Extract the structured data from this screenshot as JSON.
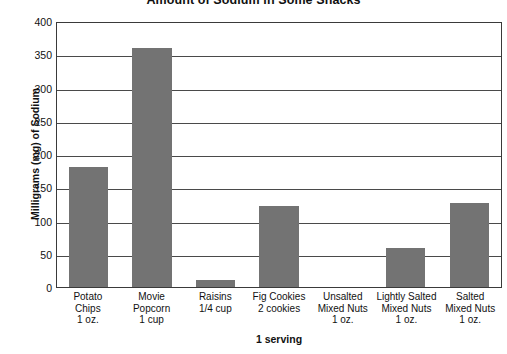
{
  "chart_data": {
    "type": "bar",
    "title": "Amount of Sodium in Some Snacks",
    "xlabel": "1 serving",
    "ylabel": "Milligrams (mg) of Sodium",
    "ylim": [
      0,
      400
    ],
    "ytick_step": 50,
    "yticks": [
      "400",
      "350",
      "300",
      "250",
      "200",
      "150",
      "100",
      "50",
      "0"
    ],
    "grid": "horizontal",
    "legend": "none",
    "bar_color": "#737373",
    "categories": [
      "Potato Chips 1 oz.",
      "Movie Popcorn 1 cup",
      "Raisins 1/4 cup",
      "Fig Cookies 2 cookies",
      "Unsalted Mixed Nuts 1 oz.",
      "Lightly Salted Mixed Nuts 1 oz.",
      "Salted Mixed Nuts 1 oz."
    ],
    "category_lines": [
      [
        "Potato",
        "Chips",
        "1 oz."
      ],
      [
        "Movie",
        "Popcorn",
        "1 cup"
      ],
      [
        "Raisins",
        "1/4 cup",
        ""
      ],
      [
        "Fig Cookies",
        "2 cookies",
        ""
      ],
      [
        "Unsalted",
        "Mixed Nuts",
        "1 oz."
      ],
      [
        "Lightly Salted",
        "Mixed Nuts",
        "1 oz."
      ],
      [
        "Salted",
        "Mixed Nuts",
        "1 oz."
      ]
    ],
    "values": [
      180,
      360,
      10,
      122,
      0,
      58,
      127
    ]
  }
}
